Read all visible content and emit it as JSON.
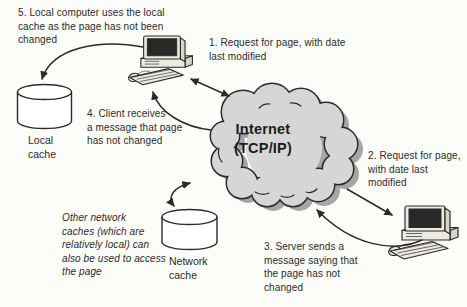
{
  "cloud": {
    "label": "Internet\n(TCP/IP)"
  },
  "nodes": {
    "local_cache_label": "Local\ncache",
    "network_cache_label": "Network\ncache"
  },
  "annotations": {
    "step1": "1. Request for page, with date\nlast modified",
    "step2": "2. Request for page,\nwith date last\nmodified",
    "step3": "3. Server sends a\nmessage saying that\nthe page has not\nchanged",
    "step4": "4. Client receives\na message that page\nhas not changed",
    "step5": "5. Local computer uses the local\ncache as the page has not been\nchanged",
    "note": "Other network\ncaches (which are\nrelatively local) can\nalso be used to access\nthe page"
  },
  "colors": {
    "bg": "#fcfcf9",
    "ink": "#2b2b2b",
    "cloud_fill": "#d6d6d6",
    "cloud_shadow": "#a6a6a6",
    "paper": "#ffffff",
    "machine_light": "#edeadf",
    "machine_mid": "#d9d5c6",
    "screen": "#282828"
  }
}
